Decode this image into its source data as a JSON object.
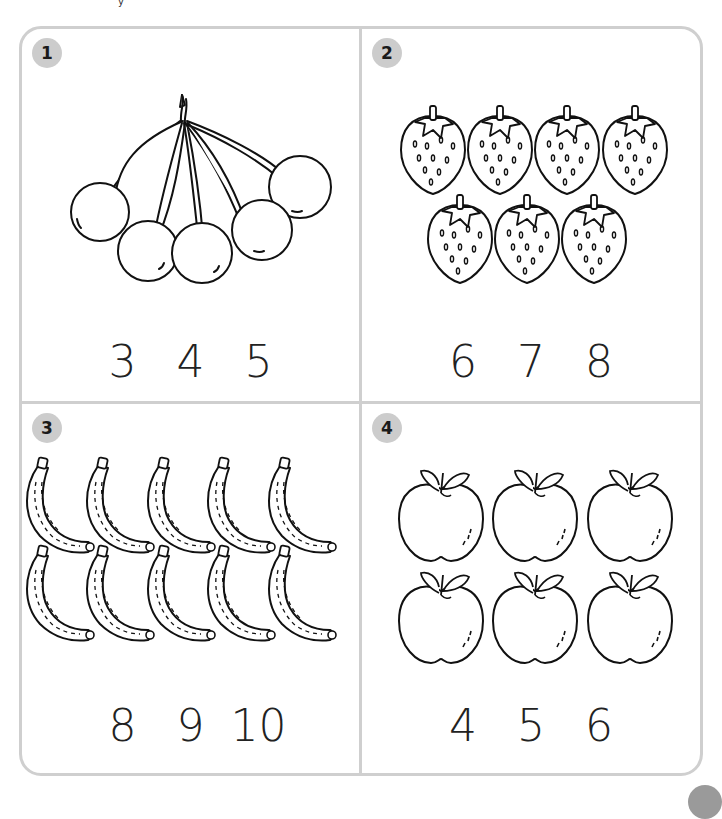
{
  "worksheet": {
    "top_text_fragment": "y",
    "frame_color": "#cfcfcf",
    "badge_color": "#cccccc",
    "problems": [
      {
        "number": "1",
        "item": "cherries",
        "count_shown": 5,
        "choices": [
          "3",
          "4",
          "5"
        ]
      },
      {
        "number": "2",
        "item": "strawberries",
        "count_shown": 7,
        "choices": [
          "6",
          "7",
          "8"
        ]
      },
      {
        "number": "3",
        "item": "bananas",
        "count_shown": 10,
        "choices": [
          "8",
          "9",
          "10"
        ]
      },
      {
        "number": "4",
        "item": "apples",
        "count_shown": 6,
        "choices": [
          "4",
          "5",
          "6"
        ]
      }
    ]
  }
}
